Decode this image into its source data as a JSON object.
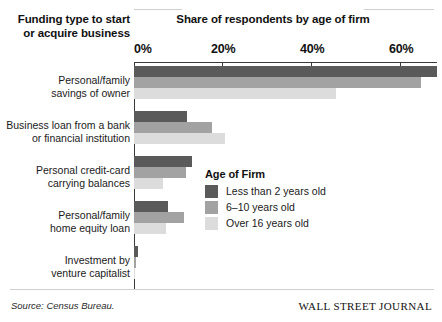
{
  "header": {
    "left_title": "Funding type to start or acquire business",
    "right_title": "Share of respondents by age of firm"
  },
  "footer": {
    "source": "Source: Census Bureau.",
    "brand": "WALL STREET JOURNAL"
  },
  "legend": {
    "title": "Age of Firm",
    "items": [
      {
        "label": "Less than 2 years old",
        "color": "#5a5a5a"
      },
      {
        "label": "6–10 years old",
        "color": "#a2a2a2"
      },
      {
        "label": "Over 16 years old",
        "color": "#dcdcdc"
      }
    ]
  },
  "axis": {
    "ticks": [
      {
        "label": "0%",
        "value": 0
      },
      {
        "label": "20%",
        "value": 20
      },
      {
        "label": "40%",
        "value": 40
      },
      {
        "label": "60%",
        "value": 60
      }
    ]
  },
  "categories_display": [
    [
      "Personal/family",
      "savings of owner"
    ],
    [
      "Business loan from a bank",
      "or financial institution"
    ],
    [
      "Personal credit-card",
      "carrying balances"
    ],
    [
      "Personal/family",
      "home equity loan"
    ],
    [
      "Investment by",
      "venture capitalist"
    ]
  ],
  "chart_data": {
    "type": "bar",
    "title": "Share of respondents by age of firm",
    "subtitle": "Funding type to start or acquire business",
    "orientation": "horizontal",
    "xlabel": "",
    "ylabel": "Funding type to start or acquire business",
    "xlim": [
      0,
      69
    ],
    "xtick_labels": [
      "0%",
      "20%",
      "40%",
      "60%"
    ],
    "xtick_values": [
      0,
      20,
      40,
      60
    ],
    "grid": false,
    "legend_position": "middle-right",
    "categories": [
      "Personal/family savings of owner",
      "Business loan from a bank or financial institution",
      "Personal credit-card carrying balances",
      "Personal/family home equity loan",
      "Investment by venture capitalist"
    ],
    "series": [
      {
        "name": "Less than 2 years old",
        "color": "#5a5a5a",
        "values": [
          68.3,
          12.0,
          13.1,
          7.7,
          1.0
        ]
      },
      {
        "name": "6–10 years old",
        "color": "#a2a2a2",
        "values": [
          64.7,
          17.7,
          11.7,
          11.3,
          0.4
        ]
      },
      {
        "name": "Over 16 years old",
        "color": "#dcdcdc",
        "values": [
          45.6,
          20.6,
          6.5,
          7.2,
          0.2
        ]
      }
    ],
    "source": "Census Bureau."
  }
}
